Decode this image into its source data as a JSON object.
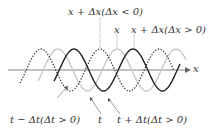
{
  "diagram": {
    "axis_label": "x",
    "top_labels": {
      "shift_negative": "x + Δx(Δx < 0)",
      "origin": "x",
      "shift_positive": "x + Δx(Δx > 0)"
    },
    "bottom_labels": {
      "earlier": "t − Δt(Δt > 0)",
      "current": "t",
      "later": "t + Δt(Δt > 0)"
    },
    "curves": [
      {
        "name": "earlier-wave",
        "style": "dotted",
        "color": "#333333",
        "phase_peak_x": 100
      },
      {
        "name": "current-wave",
        "style": "solid",
        "color": "#c8c8c8",
        "phase_peak_x": 117
      },
      {
        "name": "later-wave",
        "style": "solid",
        "color": "#222222",
        "phase_peak_x": 133
      }
    ]
  }
}
